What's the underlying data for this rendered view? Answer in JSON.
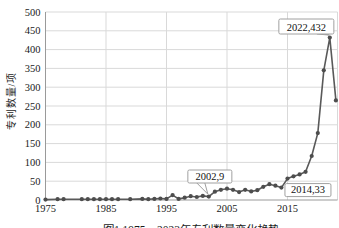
{
  "figure": {
    "caption": "图1 1975—2023年专利数量变化趋势"
  },
  "chart_data": {
    "type": "line",
    "title": "",
    "xlabel": "",
    "ylabel": "专利数量/项",
    "ylim": [
      0,
      500
    ],
    "xlim": [
      1974,
      2024
    ],
    "grid": "on",
    "legend": "none",
    "x_ticks": [
      1975,
      1985,
      1995,
      2005,
      2015
    ],
    "y_ticks": [
      0,
      50,
      100,
      150,
      200,
      250,
      300,
      350,
      400,
      450,
      500
    ],
    "series": [
      {
        "name": "专利数量",
        "points": [
          [
            1975,
            1
          ],
          [
            1977,
            2
          ],
          [
            1978,
            2
          ],
          [
            1981,
            2
          ],
          [
            1982,
            2
          ],
          [
            1983,
            2
          ],
          [
            1984,
            2
          ],
          [
            1985,
            2
          ],
          [
            1986,
            2
          ],
          [
            1987,
            2
          ],
          [
            1989,
            2
          ],
          [
            1991,
            3
          ],
          [
            1992,
            2
          ],
          [
            1993,
            3
          ],
          [
            1994,
            4
          ],
          [
            1995,
            3
          ],
          [
            1996,
            13
          ],
          [
            1997,
            3
          ],
          [
            1998,
            6
          ],
          [
            1999,
            10
          ],
          [
            2000,
            8
          ],
          [
            2001,
            11
          ],
          [
            2002,
            9
          ],
          [
            2003,
            22
          ],
          [
            2004,
            27
          ],
          [
            2005,
            30
          ],
          [
            2006,
            27
          ],
          [
            2007,
            21
          ],
          [
            2008,
            27
          ],
          [
            2009,
            23
          ],
          [
            2010,
            26
          ],
          [
            2011,
            35
          ],
          [
            2012,
            42
          ],
          [
            2013,
            38
          ],
          [
            2014,
            33
          ],
          [
            2015,
            57
          ],
          [
            2016,
            63
          ],
          [
            2017,
            68
          ],
          [
            2018,
            75
          ],
          [
            2019,
            117
          ],
          [
            2020,
            178
          ],
          [
            2021,
            345
          ],
          [
            2022,
            432
          ],
          [
            2023,
            265
          ]
        ]
      }
    ],
    "annotations": [
      {
        "label": "2002,9",
        "year": 2002,
        "value": 9,
        "placement": "above-right"
      },
      {
        "label": "2014,33",
        "year": 2014,
        "value": 33,
        "placement": "below-right"
      },
      {
        "label": "2022,432",
        "year": 2022,
        "value": 432,
        "placement": "above-left"
      }
    ],
    "colors": {
      "line": "#595959",
      "marker": "#4d4d4d",
      "grid": "#d9d9d9",
      "axis": "#9a9a9a",
      "tick_text": "#1a1a1a",
      "annotation_border": "#a0a0a0",
      "annotation_bg": "#ffffff",
      "annotation_text": "#111111"
    }
  }
}
